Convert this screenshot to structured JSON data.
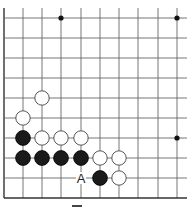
{
  "diagram": {
    "type": "go-board-fragment",
    "grid": {
      "columns_x": [
        4,
        23,
        42,
        61,
        81,
        100,
        119,
        138,
        158,
        177
      ],
      "rows_y": [
        18,
        38,
        58,
        78,
        98,
        118,
        138,
        158,
        178,
        198
      ],
      "line_color": "#666666",
      "edge_color": "#333333"
    },
    "star_points": [
      [
        61,
        18
      ],
      [
        177,
        18
      ],
      [
        177,
        138
      ]
    ],
    "stones": {
      "white": [
        [
          42,
          98
        ],
        [
          23,
          118
        ],
        [
          42,
          138
        ],
        [
          61,
          138
        ],
        [
          81,
          138
        ],
        [
          100,
          158
        ],
        [
          119,
          158
        ],
        [
          119,
          178
        ]
      ],
      "black": [
        [
          23,
          138
        ],
        [
          23,
          158
        ],
        [
          42,
          158
        ],
        [
          61,
          158
        ],
        [
          81,
          158
        ],
        [
          100,
          178
        ]
      ]
    },
    "labels": [
      {
        "text": "A",
        "x": 81,
        "y": 178
      }
    ],
    "caption_mark": {
      "x": 72,
      "y": 205,
      "w": 10,
      "h": 2
    }
  }
}
